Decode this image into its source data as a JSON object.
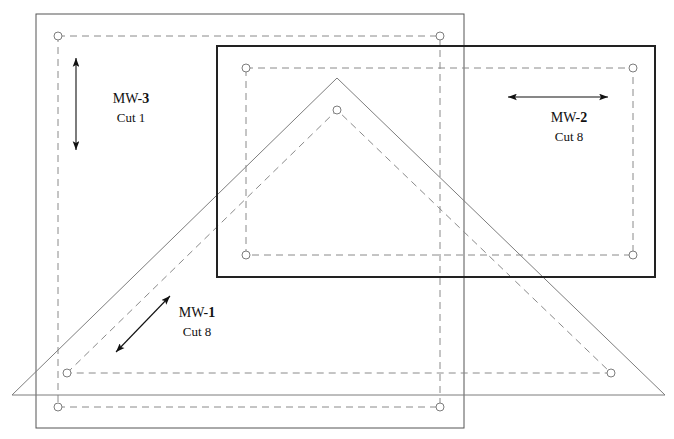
{
  "sheet": {
    "width": 674,
    "height": 439,
    "background": "#ffffff",
    "description": "Quilt pattern cutting layout diagram"
  },
  "colors": {
    "cut_line_thin": "#555555",
    "cut_line_bold": "#222222",
    "seam_line_dashed": "#8a8a8a",
    "triangle_outline": "#7d7d7d",
    "marker_stroke": "#7d7d7d",
    "arrow": "#111111",
    "text": "#111111"
  },
  "shapes": [
    {
      "name": "square-piece-mw3",
      "type": "rect",
      "style": "cut-thin",
      "x": 36,
      "y": 14,
      "width": 428,
      "height": 414
    },
    {
      "name": "square-piece-mw3-seam",
      "type": "rect",
      "style": "seam-dashed",
      "x": 58,
      "y": 36,
      "width": 382,
      "height": 371,
      "corner_markers": true
    },
    {
      "name": "rect-piece-mw2",
      "type": "rect",
      "style": "cut-bold",
      "x": 217,
      "y": 46,
      "width": 438,
      "height": 231
    },
    {
      "name": "rect-piece-mw2-seam",
      "type": "rect",
      "style": "seam-dashed",
      "x": 246,
      "y": 68,
      "width": 387,
      "height": 187,
      "corner_markers": true
    },
    {
      "name": "triangle-piece-mw1",
      "type": "polygon",
      "style": "cut-thin",
      "points": "12,395 337,78 665,395"
    },
    {
      "name": "triangle-piece-mw1-seam",
      "type": "polygon",
      "style": "seam-dashed",
      "points": "67,373 337,110 611,373",
      "corner_markers": true
    }
  ],
  "markers": [
    {
      "name": "seam-corner-marker",
      "x": 58,
      "y": 36
    },
    {
      "name": "seam-corner-marker",
      "x": 440,
      "y": 36
    },
    {
      "name": "seam-corner-marker",
      "x": 58,
      "y": 407
    },
    {
      "name": "seam-corner-marker",
      "x": 440,
      "y": 407
    },
    {
      "name": "seam-corner-marker",
      "x": 246,
      "y": 68
    },
    {
      "name": "seam-corner-marker",
      "x": 633,
      "y": 68
    },
    {
      "name": "seam-corner-marker",
      "x": 246,
      "y": 255
    },
    {
      "name": "seam-corner-marker",
      "x": 633,
      "y": 255
    },
    {
      "name": "seam-corner-marker",
      "x": 337,
      "y": 110
    },
    {
      "name": "seam-corner-marker",
      "x": 67,
      "y": 373
    },
    {
      "name": "seam-corner-marker",
      "x": 611,
      "y": 373
    }
  ],
  "grain_arrows": [
    {
      "name": "grain-arrow-mw3",
      "orientation": "vertical",
      "x1": 76,
      "y1": 58,
      "x2": 76,
      "y2": 150
    },
    {
      "name": "grain-arrow-mw2",
      "orientation": "horizontal",
      "x1": 508,
      "y1": 97,
      "x2": 608,
      "y2": 97
    },
    {
      "name": "grain-arrow-mw1",
      "orientation": "diagonal",
      "x1": 116,
      "y1": 352,
      "x2": 170,
      "y2": 296
    }
  ],
  "labels": [
    {
      "name": "piece-label-mw3",
      "prefix": "MW-",
      "number": "3",
      "cut": "Cut 1",
      "x": 131,
      "y": 103,
      "cut_y": 122
    },
    {
      "name": "piece-label-mw2",
      "prefix": "MW-",
      "number": "2",
      "cut": "Cut 8",
      "x": 569,
      "y": 122,
      "cut_y": 141
    },
    {
      "name": "piece-label-mw1",
      "prefix": "MW-",
      "number": "1",
      "cut": "Cut 8",
      "x": 197,
      "y": 317,
      "cut_y": 336
    }
  ]
}
